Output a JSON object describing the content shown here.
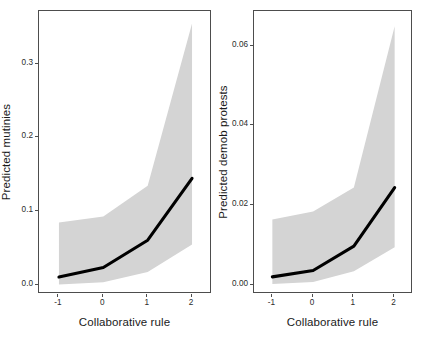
{
  "figure": {
    "width": 433,
    "height": 338,
    "background": "#ffffff",
    "band_color": "#d4d4d4",
    "line_color": "#000000",
    "frame_color": "#4d4d4d"
  },
  "chart_data": [
    {
      "type": "line",
      "panel": "left",
      "title": "",
      "xlabel": "Collaborative rule",
      "ylabel": "Predicted mutinies",
      "x": [
        -1,
        0,
        1,
        2
      ],
      "xlim": [
        -1.45,
        2.45
      ],
      "ylim": [
        -0.012,
        0.372
      ],
      "xticks": [
        -1,
        0,
        1,
        2
      ],
      "xticklabels": [
        "-1",
        "0",
        "1",
        "2"
      ],
      "yticks": [
        0.0,
        0.1,
        0.2,
        0.3
      ],
      "yticklabels": [
        "0.0",
        "0.1",
        "0.2",
        "0.3"
      ],
      "grid": false,
      "legend": "none",
      "series": [
        {
          "name": "Predicted mutinies",
          "values": [
            0.011,
            0.024,
            0.061,
            0.145
          ]
        },
        {
          "name": "CI upper",
          "values": [
            0.085,
            0.093,
            0.135,
            0.355
          ]
        },
        {
          "name": "CI lower",
          "values": [
            0.001,
            0.004,
            0.018,
            0.055
          ]
        }
      ]
    },
    {
      "type": "line",
      "panel": "right",
      "title": "",
      "xlabel": "Collaborative rule",
      "ylabel": "Predicted demob protests",
      "x": [
        -1,
        0,
        1,
        2
      ],
      "xlim": [
        -1.45,
        2.45
      ],
      "ylim": [
        -0.0022,
        0.0688
      ],
      "xticks": [
        -1,
        0,
        1,
        2
      ],
      "xticklabels": [
        "-1",
        "0",
        "1",
        "2"
      ],
      "yticks": [
        0.0,
        0.02,
        0.04,
        0.06
      ],
      "yticklabels": [
        "0.00",
        "0.02",
        "0.04",
        "0.06"
      ],
      "grid": false,
      "legend": "none",
      "series": [
        {
          "name": "Predicted demob protests",
          "values": [
            0.0021,
            0.0037,
            0.0098,
            0.0245
          ]
        },
        {
          "name": "CI upper",
          "values": [
            0.0165,
            0.0185,
            0.0245,
            0.065
          ]
        },
        {
          "name": "CI lower",
          "values": [
            0.0003,
            0.0008,
            0.0035,
            0.0095
          ]
        }
      ]
    }
  ]
}
